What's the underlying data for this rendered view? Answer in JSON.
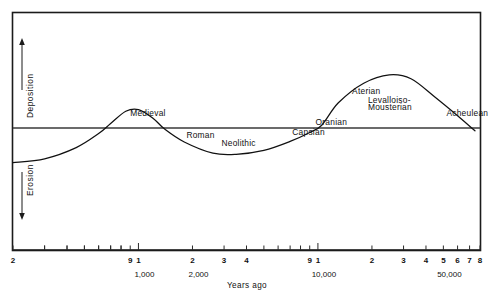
{
  "chart_data": {
    "type": "line",
    "title": "",
    "xlabel": "Years ago",
    "ylabel": "",
    "x_scale": "log",
    "xlim": [
      200,
      80000
    ],
    "ylim": [
      -1.25,
      1.25
    ],
    "grid": false,
    "legend": null,
    "zero_line_label": "",
    "y_axis_sections": [
      {
        "name": "Deposition",
        "direction": "up",
        "arrow": "↑"
      },
      {
        "name": "Erosion",
        "direction": "down",
        "arrow": "↓"
      }
    ],
    "x_decade_labels": [
      {
        "value": 1000,
        "text": "1,000"
      },
      {
        "value": 2000,
        "text": "2,000"
      },
      {
        "value": 10000,
        "text": "10,000"
      },
      {
        "value": 50000,
        "text": "50,000"
      }
    ],
    "x_tick_labels": [
      {
        "value": 200,
        "text": "2"
      },
      {
        "value": 900,
        "text": "9"
      },
      {
        "value": 1000,
        "text": "1"
      },
      {
        "value": 2000,
        "text": "2"
      },
      {
        "value": 3000,
        "text": "3"
      },
      {
        "value": 4000,
        "text": "4"
      },
      {
        "value": 9000,
        "text": "9"
      },
      {
        "value": 10000,
        "text": "1"
      },
      {
        "value": 20000,
        "text": "2"
      },
      {
        "value": 30000,
        "text": "3"
      },
      {
        "value": 40000,
        "text": "4"
      },
      {
        "value": 50000,
        "text": "5"
      },
      {
        "value": 60000,
        "text": "6"
      },
      {
        "value": 70000,
        "text": "7"
      },
      {
        "value": 80000,
        "text": "8"
      }
    ],
    "x_minor_ticks": [
      300,
      400,
      500,
      600,
      700,
      800,
      900,
      1000,
      2000,
      3000,
      4000,
      5000,
      6000,
      7000,
      8000,
      9000,
      10000,
      20000,
      30000,
      40000,
      50000,
      60000,
      70000,
      80000
    ],
    "series": [
      {
        "name": "Erosion-deposition cycle",
        "points": [
          {
            "x": 200,
            "y": -0.62
          },
          {
            "x": 300,
            "y": -0.55
          },
          {
            "x": 450,
            "y": -0.35
          },
          {
            "x": 600,
            "y": -0.1
          },
          {
            "x": 700,
            "y": 0.08
          },
          {
            "x": 850,
            "y": 0.3
          },
          {
            "x": 1000,
            "y": 0.33
          },
          {
            "x": 1200,
            "y": 0.18
          },
          {
            "x": 1400,
            "y": -0.02
          },
          {
            "x": 1800,
            "y": -0.25
          },
          {
            "x": 2600,
            "y": -0.45
          },
          {
            "x": 3500,
            "y": -0.47
          },
          {
            "x": 5000,
            "y": -0.4
          },
          {
            "x": 7000,
            "y": -0.24
          },
          {
            "x": 9000,
            "y": -0.08
          },
          {
            "x": 10500,
            "y": 0.05
          },
          {
            "x": 13000,
            "y": 0.45
          },
          {
            "x": 18000,
            "y": 0.8
          },
          {
            "x": 25000,
            "y": 0.95
          },
          {
            "x": 33000,
            "y": 0.88
          },
          {
            "x": 45000,
            "y": 0.55
          },
          {
            "x": 60000,
            "y": 0.22
          },
          {
            "x": 75000,
            "y": -0.05
          }
        ]
      }
    ],
    "annotations": [
      {
        "label": "Medieval",
        "x": 900,
        "y": 0.22,
        "anchor": "start"
      },
      {
        "label": "Roman",
        "x": 1850,
        "y": -0.17,
        "anchor": "start"
      },
      {
        "label": "Neolithic",
        "x": 2900,
        "y": -0.33,
        "anchor": "start"
      },
      {
        "label": "Capsian",
        "x": 7200,
        "y": -0.12,
        "anchor": "start"
      },
      {
        "label": "Oranian",
        "x": 9700,
        "y": 0.06,
        "anchor": "start"
      },
      {
        "label": "Aterian",
        "x": 15500,
        "y": 0.6,
        "anchor": "start"
      },
      {
        "label": "Levalloiso-",
        "x": 19000,
        "y": 0.45,
        "anchor": "start"
      },
      {
        "label": "Mousterian",
        "x": 19000,
        "y": 0.33,
        "anchor": "start"
      },
      {
        "label": "Acheulean",
        "x": 52000,
        "y": 0.22,
        "anchor": "start"
      }
    ]
  },
  "figure": {
    "x_axis_title": "Years ago",
    "deposition_label": "Deposition",
    "erosion_label": "Erosion",
    "up_arrow_name": "deposition-up-arrow",
    "down_arrow_name": "erosion-down-arrow"
  }
}
